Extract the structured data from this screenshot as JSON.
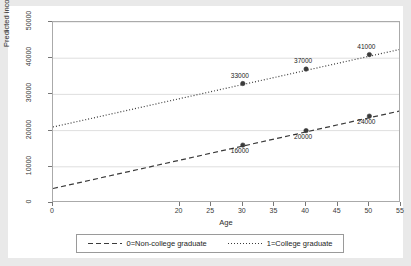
{
  "chart_data": {
    "type": "line",
    "title": "",
    "subtitle": "",
    "xlabel": "Age",
    "ylabel": "Predicted income",
    "xlim": [
      0,
      55
    ],
    "ylim": [
      0,
      50000
    ],
    "grid": "horizontal",
    "legend_position": "bottom",
    "xticks": [
      {
        "value": 0,
        "label": "0"
      },
      {
        "value": 20,
        "label": "20"
      },
      {
        "value": 25,
        "label": "25"
      },
      {
        "value": 30,
        "label": "30"
      },
      {
        "value": 35,
        "label": "35"
      },
      {
        "value": 40,
        "label": "40"
      },
      {
        "value": 45,
        "label": "45"
      },
      {
        "value": 50,
        "label": "50"
      },
      {
        "value": 55,
        "label": "55"
      }
    ],
    "yticks": [
      {
        "value": 0,
        "label": "0"
      },
      {
        "value": 10000,
        "label": "10000"
      },
      {
        "value": 20000,
        "label": "20000"
      },
      {
        "value": 30000,
        "label": "30000"
      },
      {
        "value": 40000,
        "label": "40000"
      },
      {
        "value": 50000,
        "label": "50000"
      }
    ],
    "series": [
      {
        "name": "0=Non-college graduate",
        "style": "dashed",
        "color": "#3b3b3b",
        "line": {
          "x": [
            0,
            55
          ],
          "y": [
            4000,
            25500
          ]
        },
        "points": [
          {
            "x": 30,
            "y": 16000,
            "label": "16000",
            "label_pos": "below"
          },
          {
            "x": 40,
            "y": 20000,
            "label": "20000",
            "label_pos": "below"
          },
          {
            "x": 50,
            "y": 24000,
            "label": "24000",
            "label_pos": "below"
          }
        ]
      },
      {
        "name": "1=College graduate",
        "style": "dotted",
        "color": "#3b3b3b",
        "line": {
          "x": [
            0,
            55
          ],
          "y": [
            21000,
            42500
          ]
        },
        "points": [
          {
            "x": 30,
            "y": 33000,
            "label": "33000",
            "label_pos": "above"
          },
          {
            "x": 40,
            "y": 37000,
            "label": "37000",
            "label_pos": "above"
          },
          {
            "x": 50,
            "y": 41000,
            "label": "41000",
            "label_pos": "above"
          }
        ]
      }
    ]
  },
  "legend": {
    "items": [
      {
        "label": "0=Non-college graduate",
        "style": "dashed"
      },
      {
        "label": "1=College graduate",
        "style": "dotted"
      }
    ]
  },
  "axes": {
    "x_title": "Age",
    "y_title": "Predicted income"
  },
  "colors": {
    "figure_background": "#e9e9e9",
    "plot_background": "#ffffff",
    "axis": "#777777",
    "grid": "#d5d5d5",
    "series": "#3b3b3b",
    "text": "#1d1d1d"
  }
}
